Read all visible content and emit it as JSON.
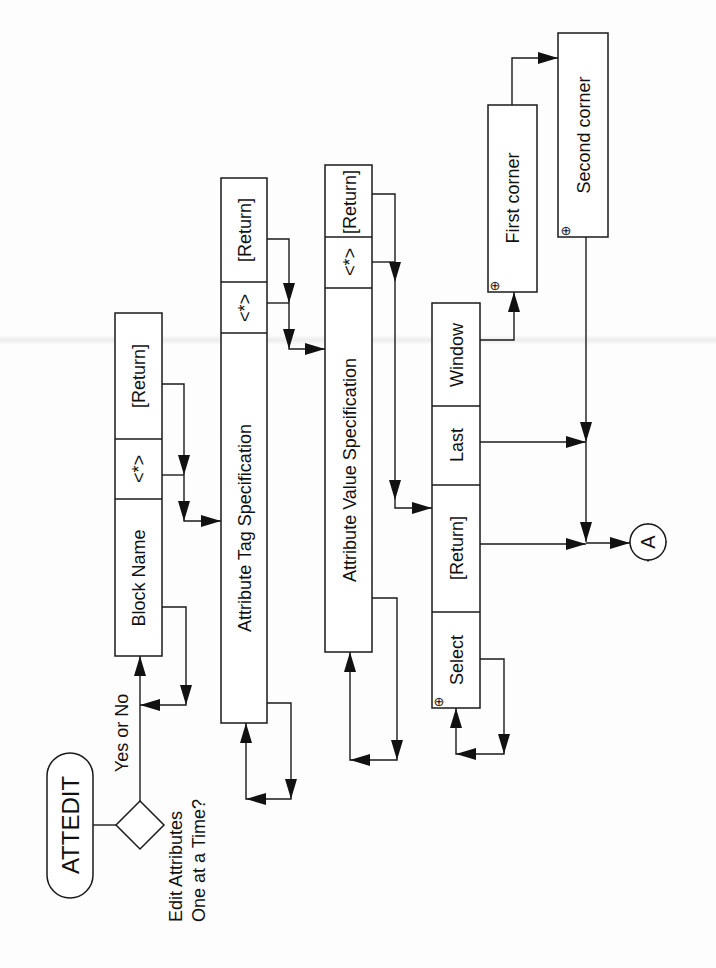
{
  "diagram": {
    "orientation": "rotated-90-ccw",
    "start": {
      "label": "ATTEDIT",
      "shape": "rounded-terminator"
    },
    "decision": {
      "question_line1": "Edit Attributes",
      "question_line2": "One at a Time?",
      "answer_label": "Yes or No"
    },
    "prompts": [
      {
        "id": "block-name",
        "cells": [
          "Block Name",
          "<*>",
          "[Return]"
        ],
        "loopback": true
      },
      {
        "id": "attribute-tag",
        "cells": [
          "Attribute Tag Specification",
          "<*>",
          "[Return]"
        ],
        "loopback": true
      },
      {
        "id": "attribute-value",
        "cells": [
          "Attribute Value Specification",
          "<*>",
          "[Return]"
        ],
        "loopback": true
      },
      {
        "id": "select-objects",
        "cells": [
          "Select",
          "[Return]",
          "Last",
          "Window"
        ],
        "pick_marker": "⊕",
        "loopback": true
      }
    ],
    "window_steps": [
      {
        "id": "first-corner",
        "label": "First corner",
        "pick_marker": "⊕"
      },
      {
        "id": "second-corner",
        "label": "Second corner",
        "pick_marker": "⊕"
      }
    ],
    "connector": {
      "label": "A",
      "shape": "off-page-circle"
    }
  }
}
